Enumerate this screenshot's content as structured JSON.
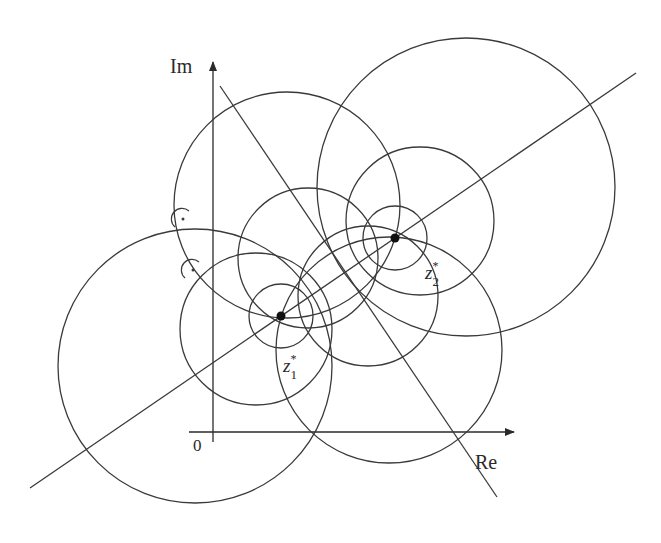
{
  "figure": {
    "type": "apollonian-circles-diagram",
    "axes": {
      "real_label": "Re",
      "imag_label": "Im",
      "origin_label": "0"
    },
    "points": [
      {
        "name": "z1*",
        "label_base": "z",
        "label_sub": "1",
        "label_sup": "*",
        "x": 281,
        "y": 316
      },
      {
        "name": "z2*",
        "label_base": "z",
        "label_sub": "2",
        "label_sup": "*",
        "x": 395,
        "y": 238
      }
    ],
    "lines": [
      {
        "name": "line-through-points",
        "x1": 30,
        "y1": 488,
        "x2": 636,
        "y2": 73
      },
      {
        "name": "perpendicular-bisector",
        "x1": 220,
        "y1": 86,
        "x2": 497,
        "y2": 497
      }
    ],
    "circles_apollonian_z1": [
      {
        "cx": 281,
        "cy": 316,
        "r": 32
      },
      {
        "cx": 256,
        "cy": 329,
        "r": 76
      },
      {
        "cx": 195,
        "cy": 366,
        "r": 137
      }
    ],
    "circles_apollonian_z2": [
      {
        "cx": 395,
        "cy": 238,
        "r": 32
      },
      {
        "cx": 420,
        "cy": 221,
        "r": 74
      },
      {
        "cx": 466,
        "cy": 187,
        "r": 149
      }
    ],
    "circles_through_points": [
      {
        "cx": 287,
        "cy": 205,
        "r": 113
      },
      {
        "cx": 389,
        "cy": 350,
        "r": 113
      },
      {
        "cx": 308,
        "cy": 258,
        "r": 70
      },
      {
        "cx": 368,
        "cy": 296,
        "r": 70
      }
    ],
    "right_angle_marks": [
      {
        "x": 183,
        "y": 219
      },
      {
        "x": 193,
        "y": 270
      }
    ],
    "colors": {
      "stroke": "#3a3a3a",
      "background": "#ffffff"
    }
  }
}
